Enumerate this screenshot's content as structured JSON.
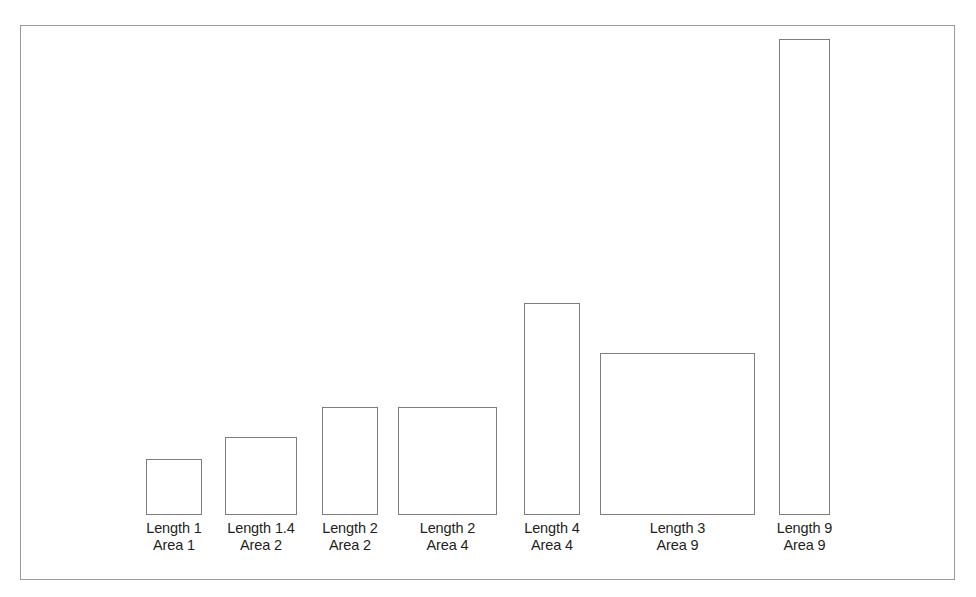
{
  "figure": {
    "background_color": "#ffffff",
    "frame_color": "#9a9a9a",
    "bar_outline_color": "#7d7d7d",
    "bar_fill_color": "#ffffff",
    "label_color": "#231f20"
  },
  "chart_data": {
    "type": "bar",
    "title": "",
    "subtitle": "",
    "xlabel": "",
    "ylabel": "",
    "grid": false,
    "legend": null,
    "axis_visible": false,
    "categories": [
      "Length 1 / Area 1",
      "Length 1.4 / Area 2",
      "Length 2 / Area 2",
      "Length 2 / Area 4",
      "Length 4 / Area 4",
      "Length 3 / Area 9",
      "Length 9 / Area 9"
    ],
    "values": [
      56,
      78,
      108,
      108,
      212,
      162,
      476
    ],
    "widths": [
      56,
      72,
      56,
      99,
      56,
      155,
      51
    ],
    "ylim": [
      0,
      490
    ],
    "bars": [
      {
        "index": 1,
        "length_label": "Length 1",
        "area_label": "Area 1",
        "length_value": 1,
        "area_value": 1,
        "x": 146,
        "y": 459,
        "width": 56,
        "height": 56
      },
      {
        "index": 2,
        "length_label": "Length 1.4",
        "area_label": "Area 2",
        "length_value": 1.4,
        "area_value": 2,
        "x": 225,
        "y": 437,
        "width": 72,
        "height": 78
      },
      {
        "index": 3,
        "length_label": "Length 2",
        "area_label": "Area 2",
        "length_value": 2,
        "area_value": 2,
        "x": 322,
        "y": 407,
        "width": 56,
        "height": 108
      },
      {
        "index": 4,
        "length_label": "Length 2",
        "area_label": "Area 4",
        "length_value": 2,
        "area_value": 4,
        "x": 398,
        "y": 407,
        "width": 99,
        "height": 108
      },
      {
        "index": 5,
        "length_label": "Length 4",
        "area_label": "Area 4",
        "length_value": 4,
        "area_value": 4,
        "x": 524,
        "y": 303,
        "width": 56,
        "height": 212
      },
      {
        "index": 6,
        "length_label": "Length 3",
        "area_label": "Area 9",
        "length_value": 3,
        "area_value": 9,
        "x": 600,
        "y": 353,
        "width": 155,
        "height": 162
      },
      {
        "index": 7,
        "length_label": "Length 9",
        "area_label": "Area 9",
        "length_value": 9,
        "area_value": 9,
        "x": 779,
        "y": 39,
        "width": 51,
        "height": 476
      }
    ],
    "baseline_y": 515
  }
}
